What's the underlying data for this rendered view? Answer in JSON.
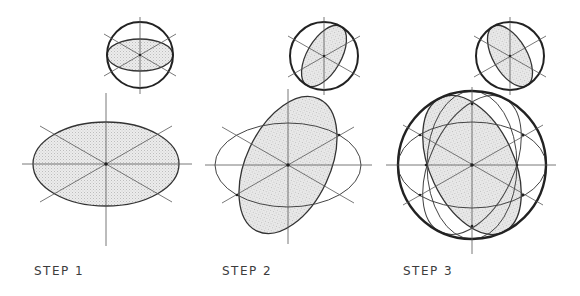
{
  "figure": {
    "steps": [
      {
        "label": "STEP 1",
        "label_x": 34,
        "small_view": {
          "cx": 140,
          "cy": 55,
          "r": 33,
          "ellipse": {
            "rx": 33,
            "ry": 16,
            "rotate": 0
          }
        },
        "main_view": {
          "cx": 106,
          "cy": 164,
          "ellipses": [
            {
              "rx": 73,
              "ry": 42,
              "rotate": 0,
              "filled": true
            }
          ]
        }
      },
      {
        "label": "STEP 2",
        "label_x": 222,
        "small_view": {
          "cx": 324,
          "cy": 56,
          "r": 34,
          "ellipse": {
            "rx": 17,
            "ry": 34,
            "rotate": 30
          }
        },
        "main_view": {
          "cx": 288,
          "cy": 165,
          "ellipses": [
            {
              "rx": 73,
              "ry": 42,
              "rotate": 0,
              "filled": false
            },
            {
              "rx": 42,
              "ry": 73,
              "rotate": 25,
              "filled": true
            }
          ]
        }
      },
      {
        "label": "STEP 3",
        "label_x": 403,
        "small_view": {
          "cx": 510,
          "cy": 56,
          "r": 34,
          "ellipse": {
            "rx": 17,
            "ry": 34,
            "rotate": -30
          }
        },
        "main_view": {
          "cx": 472,
          "cy": 165,
          "r": 74,
          "ellipses": [
            {
              "rx": 42,
              "ry": 74,
              "rotate": -25,
              "filled": true
            },
            {
              "rx": 74,
              "ry": 43,
              "rotate": 0,
              "filled": false
            },
            {
              "rx": 45,
              "ry": 74,
              "rotate": 0,
              "filled": false
            },
            {
              "rx": 42,
              "ry": 74,
              "rotate": 25,
              "filled": false
            }
          ]
        }
      }
    ],
    "colors": {
      "line": "#333333",
      "fill": "#e4e4e4",
      "label": "#3c3c3c"
    }
  }
}
